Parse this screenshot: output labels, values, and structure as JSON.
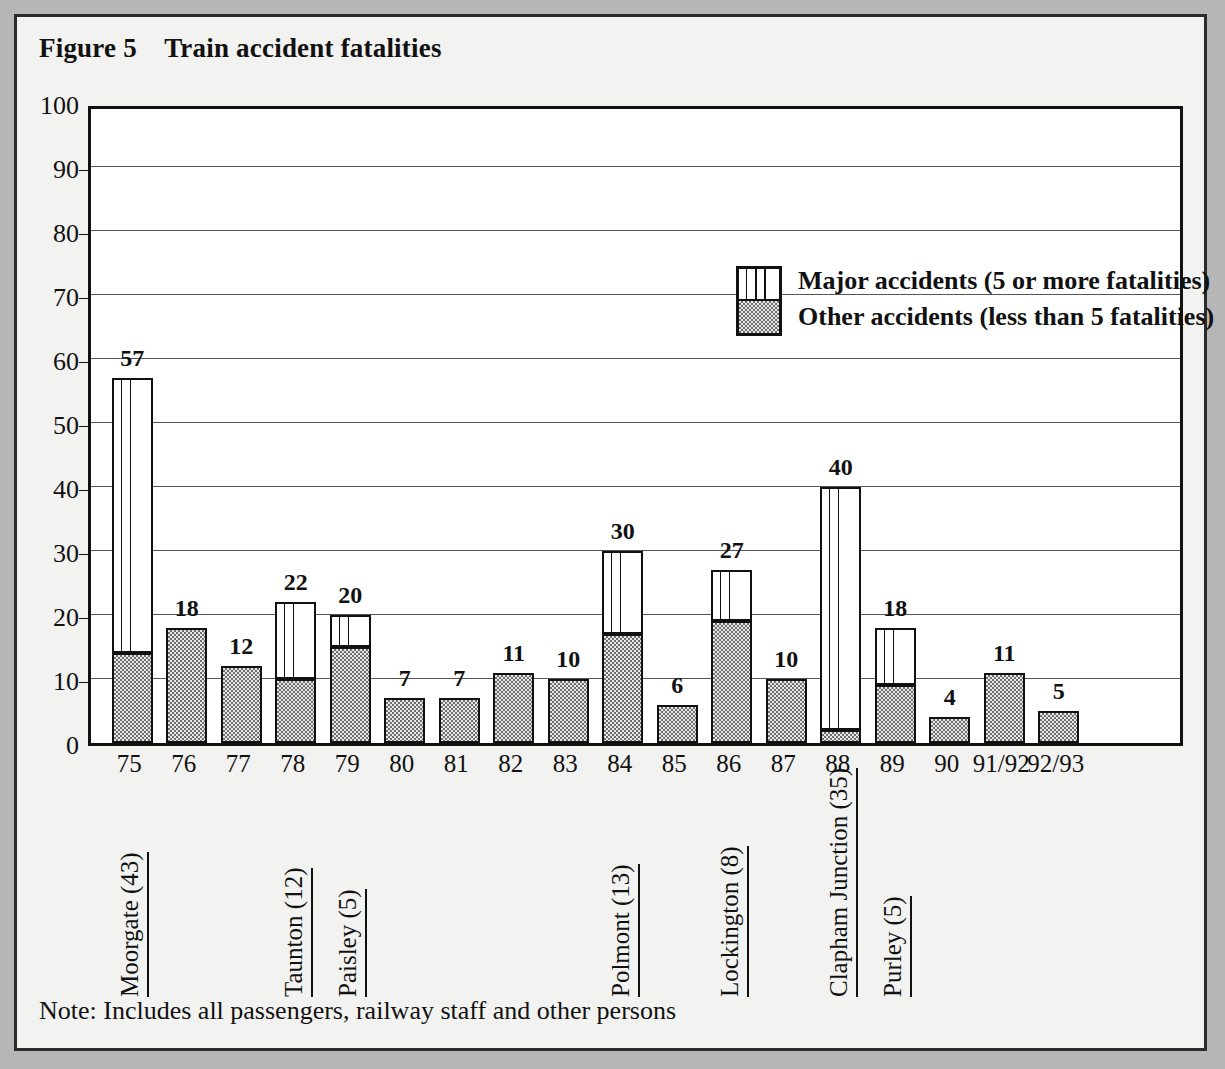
{
  "figure": {
    "title": "Figure 5    Train accident fatalities",
    "note": "Note: Includes all passengers, railway staff and other persons"
  },
  "legend": {
    "major_label": "Major accidents (5 or more fatalities)",
    "other_label": "Other accidents (less than 5 fatalities)",
    "major_swatch_name": "striped-pattern-swatch",
    "other_swatch_name": "gray-fill-swatch"
  },
  "colors": {
    "page_background": "#b6b6b6",
    "figure_background": "#f2f2f0",
    "plot_background": "#ffffff",
    "border": "#2b2b2b",
    "axis": "#111111",
    "gridline": "#555555",
    "other_fill": "#b8b8b8"
  },
  "chart_data": {
    "type": "bar",
    "title": "Figure 5    Train accident fatalities",
    "xlabel": "",
    "ylabel": "",
    "ylim": [
      0,
      100
    ],
    "ytick_step": 10,
    "yticks": [
      0,
      10,
      20,
      30,
      40,
      50,
      60,
      70,
      80,
      90,
      100
    ],
    "grid": true,
    "stacked": true,
    "legend_position": "inside-top-right",
    "categories": [
      "75",
      "76",
      "77",
      "78",
      "79",
      "80",
      "81",
      "82",
      "83",
      "84",
      "85",
      "86",
      "87",
      "88",
      "89",
      "90",
      "91/92",
      "92/93"
    ],
    "series": [
      {
        "name": "Other accidents (less than 5 fatalities)",
        "values": [
          14,
          18,
          12,
          10,
          15,
          7,
          7,
          11,
          10,
          17,
          6,
          19,
          10,
          2,
          9,
          4,
          11,
          5
        ]
      },
      {
        "name": "Major accidents (5 or more fatalities)",
        "values": [
          43,
          0,
          0,
          12,
          5,
          0,
          0,
          0,
          0,
          13,
          0,
          8,
          0,
          38,
          9,
          0,
          0,
          0
        ]
      }
    ],
    "totals": [
      57,
      18,
      12,
      22,
      20,
      7,
      7,
      11,
      10,
      30,
      6,
      27,
      10,
      40,
      18,
      4,
      11,
      5
    ],
    "data_labels": [
      "57",
      "18",
      "12",
      "22",
      "20",
      "7",
      "7",
      "11",
      "10",
      "30",
      "6",
      "27",
      "10",
      "40",
      "18",
      "4",
      "11",
      "5"
    ],
    "annotations": [
      {
        "label": "Moorgate (43)",
        "category": "75"
      },
      {
        "label": "Taunton (12)",
        "category": "78"
      },
      {
        "label": "Paisley (5)",
        "category": "79"
      },
      {
        "label": "Polmont (13)",
        "category": "84"
      },
      {
        "label": "Lockington (8)",
        "category": "86"
      },
      {
        "label": "Clapham Junction (35)",
        "category": "88"
      },
      {
        "label": "Purley (5)",
        "category": "89"
      }
    ]
  }
}
